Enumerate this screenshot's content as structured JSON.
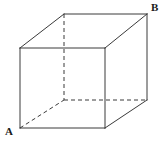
{
  "figure": {
    "name": "cube-diagram",
    "background_color": "#ffffff",
    "stroke_color": "#3a3a3a",
    "stroke_width": 1,
    "hidden_stroke_dash": "4 3",
    "width": 165,
    "height": 145
  },
  "labels": {
    "a": "A",
    "b": "B"
  },
  "geometry": {
    "front_face": {
      "top_left": [
        20,
        48
      ],
      "top_right": [
        105,
        48
      ],
      "bottom_right": [
        105,
        128
      ],
      "bottom_left": [
        20,
        128
      ]
    },
    "back_face": {
      "top_left": [
        64,
        14
      ],
      "top_right": [
        147,
        14
      ],
      "bottom_right": [
        147,
        100
      ],
      "bottom_left": [
        64,
        100
      ]
    },
    "visible_edges": [
      "front-top",
      "front-right",
      "front-bottom",
      "front-left",
      "back-top",
      "back-right",
      "connect-top-left",
      "connect-top-right",
      "connect-bottom-right"
    ],
    "hidden_edges": [
      "back-left",
      "back-bottom",
      "connect-bottom-left"
    ]
  }
}
